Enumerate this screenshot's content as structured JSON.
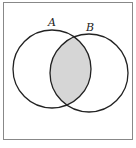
{
  "diagram": {
    "type": "venn",
    "sets": [
      {
        "label": "A",
        "cx": 52,
        "cy": 69,
        "r": 39
      },
      {
        "label": "B",
        "cx": 89,
        "cy": 73,
        "r": 39
      }
    ],
    "shaded_region": "A ∩ B",
    "colors": {
      "stroke": "#222222",
      "shade": "#d6d6d6",
      "frame": "#888888",
      "background": "#ffffff"
    }
  }
}
